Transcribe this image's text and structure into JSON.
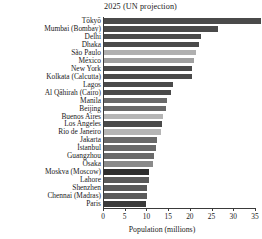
{
  "chart_data": {
    "type": "bar",
    "orientation": "horizontal",
    "title": "2025 (UN projection)",
    "xlabel": "Population (millions)",
    "ylabel": "",
    "xlim": [
      0,
      35
    ],
    "xticks": [
      0,
      5,
      10,
      15,
      20,
      25,
      30,
      35
    ],
    "xticklabels": [
      "0",
      "5",
      "10",
      "15",
      "20",
      "25",
      "30",
      "35"
    ],
    "grid": false,
    "legend": null,
    "categories": [
      "Tōkyō",
      "Mumbai (Bombay)",
      "Delhi",
      "Dhaka",
      "São Paulo",
      "México",
      "New York",
      "Kolkata (Calcutta)",
      "Lagos",
      "Al Qāhirah (Cairo)",
      "Manila",
      "Beijing",
      "Buenos Aires",
      "Los Angeles",
      "Rio de Janeiro",
      "Jakarta",
      "İstanbul",
      "Guangzhou",
      "Ōsaka",
      "Moskva (Moscow)",
      "Lahore",
      "Shenzhen",
      "Chennai (Madras)",
      "Paris"
    ],
    "values": [
      36.4,
      26.4,
      22.5,
      22.0,
      21.4,
      21.0,
      20.6,
      20.6,
      16.1,
      15.6,
      14.8,
      14.5,
      13.8,
      13.7,
      13.4,
      12.4,
      12.1,
      11.8,
      11.4,
      10.5,
      10.5,
      10.2,
      10.1,
      10.0
    ],
    "bar_colors": [
      "#4a4a4a",
      "#4a4a4a",
      "#4a4a4a",
      "#4a4a4a",
      "#b0b0b0",
      "#a0a0a0",
      "#4a4a4a",
      "#4a4a4a",
      "#4a4a4a",
      "#4a4a4a",
      "#6a6a6a",
      "#6a6a6a",
      "#b5b5b5",
      "#4a4a4a",
      "#b5b5b5",
      "#6a6a6a",
      "#6a6a6a",
      "#6a6a6a",
      "#8a8a8a",
      "#2e2e2e",
      "#5a5a5a",
      "#5a5a5a",
      "#5a5a5a",
      "#3a3a3a"
    ],
    "axis_color": "#3a3a3a",
    "text_color": "#1a1a1a",
    "background": "#ffffff"
  }
}
